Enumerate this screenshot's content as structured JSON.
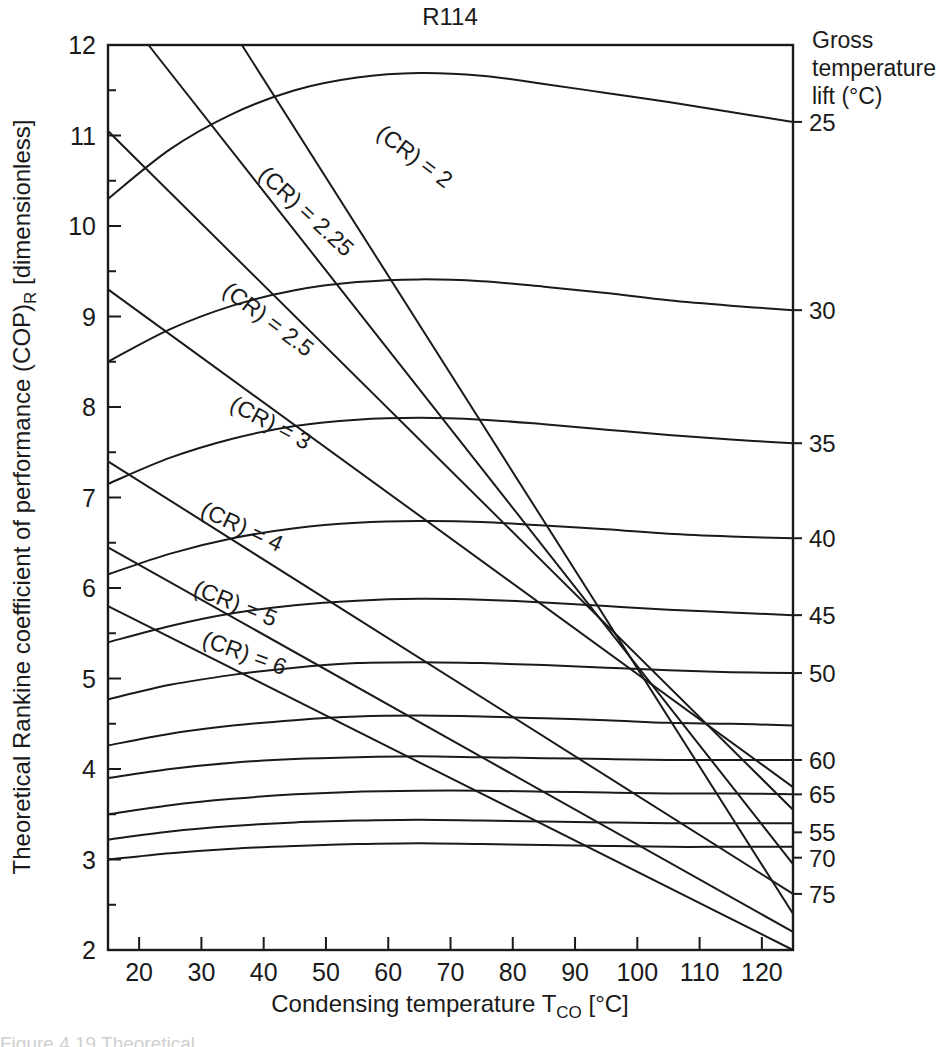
{
  "figure": {
    "title": "R114",
    "caption_partial": "Figure 4.19  Theoretical..."
  },
  "axes": {
    "x_label": "Condensing temperature T",
    "x_label_sub": "CO",
    "x_label_unit": " [°C]",
    "y_label": "Theoretical Rankine coefficient of performance (COP)",
    "y_label_sub": "R",
    "y_label_unit": " [dimensionless]",
    "x_ticks": [
      20,
      30,
      40,
      50,
      60,
      70,
      80,
      90,
      100,
      110,
      120
    ],
    "y_ticks": [
      2,
      3,
      4,
      5,
      6,
      7,
      8,
      9,
      10,
      11,
      12
    ],
    "x_min": 15,
    "x_max": 125,
    "y_min": 2,
    "y_max": 12
  },
  "right_legend": {
    "header_lines": [
      "Gross",
      "temperature",
      "lift (°C)"
    ],
    "labels": [
      {
        "text": "25",
        "cop": 11.15
      },
      {
        "text": "30",
        "cop": 9.07
      },
      {
        "text": "35",
        "cop": 7.6
      },
      {
        "text": "40",
        "cop": 6.55
      },
      {
        "text": "45",
        "cop": 5.7
      },
      {
        "text": "50",
        "cop": 5.06
      },
      {
        "text": "60",
        "cop": 4.1
      },
      {
        "text": "65",
        "cop": 3.72
      },
      {
        "text": "55",
        "cop": 3.3
      },
      {
        "text": "70",
        "cop": 3.02
      },
      {
        "text": "75",
        "cop": 2.62
      }
    ]
  },
  "chart_data": {
    "type": "line",
    "title": "R114",
    "xlabel": "Condensing temperature T_CO [°C]",
    "ylabel": "Theoretical Rankine coefficient of performance (COP)_R [dimensionless]",
    "xlim": [
      15,
      125
    ],
    "ylim": [
      2,
      12
    ],
    "grid": false,
    "legend_position": "right-axis-labels",
    "series_groups": [
      {
        "group": "gross-temperature-lift",
        "unit": "°C",
        "shape": "concave-down arc",
        "series": [
          {
            "name": "25",
            "x": [
              15,
              25,
              35,
              45,
              55,
              65,
              75,
              85,
              95,
              105,
              115,
              125
            ],
            "y": [
              10.3,
              10.85,
              11.24,
              11.5,
              11.64,
              11.69,
              11.66,
              11.57,
              11.47,
              11.37,
              11.26,
              11.15
            ]
          },
          {
            "name": "30",
            "x": [
              15,
              25,
              35,
              45,
              55,
              65,
              75,
              85,
              95,
              105,
              115,
              125
            ],
            "y": [
              8.5,
              8.86,
              9.12,
              9.29,
              9.38,
              9.41,
              9.39,
              9.33,
              9.26,
              9.18,
              9.12,
              9.07
            ]
          },
          {
            "name": "35",
            "x": [
              15,
              25,
              35,
              45,
              55,
              65,
              75,
              85,
              95,
              105,
              115,
              125
            ],
            "y": [
              7.15,
              7.44,
              7.65,
              7.79,
              7.86,
              7.88,
              7.86,
              7.81,
              7.75,
              7.69,
              7.64,
              7.6
            ]
          },
          {
            "name": "40",
            "x": [
              15,
              25,
              35,
              45,
              55,
              65,
              75,
              85,
              95,
              105,
              115,
              125
            ],
            "y": [
              6.15,
              6.38,
              6.55,
              6.66,
              6.72,
              6.74,
              6.73,
              6.69,
              6.65,
              6.6,
              6.57,
              6.55
            ]
          },
          {
            "name": "45",
            "x": [
              15,
              25,
              35,
              45,
              55,
              65,
              75,
              85,
              95,
              105,
              115,
              125
            ],
            "y": [
              5.4,
              5.58,
              5.72,
              5.81,
              5.86,
              5.88,
              5.87,
              5.84,
              5.8,
              5.76,
              5.73,
              5.7
            ]
          },
          {
            "name": "50",
            "x": [
              15,
              25,
              35,
              45,
              55,
              65,
              75,
              85,
              95,
              105,
              115,
              125
            ],
            "y": [
              4.77,
              4.93,
              5.04,
              5.12,
              5.17,
              5.18,
              5.17,
              5.15,
              5.12,
              5.09,
              5.07,
              5.06
            ]
          },
          {
            "name": "60",
            "x": [
              15,
              25,
              35,
              45,
              55,
              65,
              75,
              85,
              95,
              105,
              115,
              125
            ],
            "y": [
              4.26,
              4.39,
              4.48,
              4.54,
              4.58,
              4.59,
              4.58,
              4.56,
              4.54,
              4.51,
              4.5,
              4.48
            ]
          },
          {
            "name": "65",
            "x": [
              15,
              25,
              35,
              45,
              55,
              65,
              75,
              85,
              95,
              105,
              115,
              125
            ],
            "y": [
              3.9,
              4.0,
              4.07,
              4.11,
              4.13,
              4.14,
              4.13,
              4.12,
              4.11,
              4.1,
              4.1,
              4.1
            ]
          },
          {
            "name": "55",
            "x": [
              15,
              25,
              35,
              45,
              55,
              65,
              75,
              85,
              95,
              105,
              115,
              125
            ],
            "y": [
              3.5,
              3.6,
              3.67,
              3.72,
              3.75,
              3.76,
              3.76,
              3.75,
              3.74,
              3.73,
              3.73,
              3.72
            ]
          },
          {
            "name": "70",
            "x": [
              15,
              25,
              35,
              45,
              55,
              65,
              75,
              85,
              95,
              105,
              115,
              125
            ],
            "y": [
              3.22,
              3.31,
              3.37,
              3.41,
              3.43,
              3.44,
              3.43,
              3.42,
              3.41,
              3.4,
              3.4,
              3.4
            ]
          },
          {
            "name": "75",
            "x": [
              15,
              25,
              35,
              45,
              55,
              65,
              75,
              85,
              95,
              105,
              115,
              125
            ],
            "y": [
              3.0,
              3.07,
              3.12,
              3.15,
              3.17,
              3.18,
              3.17,
              3.16,
              3.15,
              3.14,
              3.14,
              3.14
            ]
          }
        ]
      },
      {
        "group": "compression-ratio",
        "shape": "straight descending line",
        "series": [
          {
            "name": "(CR) = 2",
            "label": "(CR) = 2",
            "x": [
              36.5,
              125.0
            ],
            "y": [
              12.0,
              2.4
            ]
          },
          {
            "name": "(CR) = 2.25",
            "label": "(CR) = 2.25",
            "x": [
              21.5,
              125.0
            ],
            "y": [
              12.0,
              2.95
            ]
          },
          {
            "name": "(CR) = 2.5",
            "label": "(CR) = 2.5",
            "x": [
              15.0,
              125.0
            ],
            "y": [
              11.05,
              3.55
            ]
          },
          {
            "name": "(CR) = 3",
            "label": "(CR) = 3",
            "x": [
              15.0,
              125.0
            ],
            "y": [
              9.3,
              3.8
            ]
          },
          {
            "name": "(CR) = 4",
            "label": "(CR) = 4",
            "x": [
              15.0,
              125.0
            ],
            "y": [
              7.4,
              2.62
            ]
          },
          {
            "name": "(CR) = 5",
            "label": "(CR) = 5",
            "x": [
              15.0,
              125.0
            ],
            "y": [
              6.45,
              2.2
            ]
          },
          {
            "name": "(CR) = 6",
            "label": "(CR) = 6",
            "x": [
              15.0,
              125.0
            ],
            "y": [
              5.8,
              2.0
            ]
          }
        ]
      }
    ],
    "cr_label_anchors": [
      {
        "label": "(CR) = 2",
        "x": 63.5,
        "y": 10.7,
        "angle": 37
      },
      {
        "label": "(CR) = 2.25",
        "x": 46.0,
        "y": 10.1,
        "angle": 43
      },
      {
        "label": "(CR) = 2.5",
        "x": 40.0,
        "y": 8.9,
        "angle": 37
      },
      {
        "label": "(CR) = 3",
        "x": 40.5,
        "y": 7.75,
        "angle": 28
      },
      {
        "label": "(CR) = 4",
        "x": 36.0,
        "y": 6.6,
        "angle": 25
      },
      {
        "label": "(CR) = 5",
        "x": 35.0,
        "y": 5.75,
        "angle": 22
      },
      {
        "label": "(CR) = 6",
        "x": 36.5,
        "y": 5.2,
        "angle": 20
      }
    ]
  }
}
